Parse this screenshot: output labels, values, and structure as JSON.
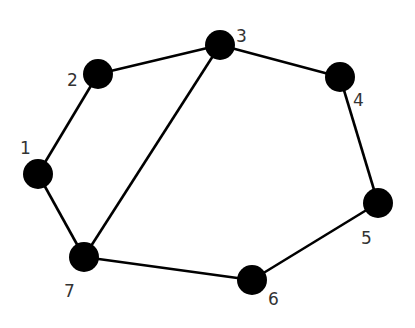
{
  "diagram": {
    "type": "undirected-graph",
    "node_color": "#000000",
    "edge_color": "#000000",
    "label_color": "#333333",
    "nodes": [
      {
        "id": "1",
        "label": "1",
        "x": 38,
        "y": 174,
        "lx": 20,
        "ly": 154
      },
      {
        "id": "2",
        "label": "2",
        "x": 98,
        "y": 74,
        "lx": 67,
        "ly": 86
      },
      {
        "id": "3",
        "label": "3",
        "x": 220,
        "y": 45,
        "lx": 236,
        "ly": 42
      },
      {
        "id": "4",
        "label": "4",
        "x": 340,
        "y": 77,
        "lx": 353,
        "ly": 106
      },
      {
        "id": "5",
        "label": "5",
        "x": 378,
        "y": 203,
        "lx": 361,
        "ly": 244
      },
      {
        "id": "6",
        "label": "6",
        "x": 252,
        "y": 280,
        "lx": 268,
        "ly": 305
      },
      {
        "id": "7",
        "label": "7",
        "x": 84,
        "y": 257,
        "lx": 64,
        "ly": 297
      }
    ],
    "edges": [
      {
        "from": "1",
        "to": "2"
      },
      {
        "from": "2",
        "to": "3"
      },
      {
        "from": "3",
        "to": "4"
      },
      {
        "from": "4",
        "to": "5"
      },
      {
        "from": "5",
        "to": "6"
      },
      {
        "from": "6",
        "to": "7"
      },
      {
        "from": "7",
        "to": "1"
      },
      {
        "from": "3",
        "to": "7"
      }
    ]
  }
}
